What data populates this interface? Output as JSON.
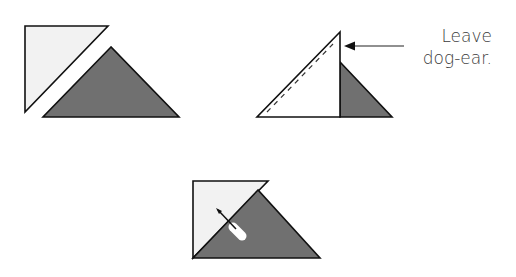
{
  "figures": [
    {
      "id": "step-1",
      "description": "Light and dark half-square triangles placed apart",
      "shapes": {
        "light_triangle": "25,26 108,26 25,112",
        "dark_triangle": "111,47 43,117 179,117"
      }
    },
    {
      "id": "step-2",
      "description": "Triangles placed right sides together, stitched along diagonal",
      "shapes": {
        "white_triangle": "340,32 257,117 340,117",
        "dark_triangle": "340,62 340,117 392,117",
        "seam_line": "262,113 334,42"
      },
      "annotation": {
        "line1": "Leave",
        "line2": "dog-ear.",
        "arrow_from": [
          404,
          46
        ],
        "arrow_to": [
          344,
          46
        ]
      }
    },
    {
      "id": "step-3",
      "description": "Light triangle pressed open and pinned to dark triangle",
      "shapes": {
        "light_area": "193,181 268,181 193,258",
        "dark_triangle": "258,190 193,258 320,258"
      },
      "pin": {
        "x1": 218,
        "y1": 210,
        "x2": 240,
        "y2": 232
      }
    }
  ],
  "colors": {
    "light_fill": "#f2f2f2",
    "white_fill": "#ffffff",
    "dark_fill": "#707070",
    "stroke": "#111111",
    "text": "#3a3a3a"
  }
}
